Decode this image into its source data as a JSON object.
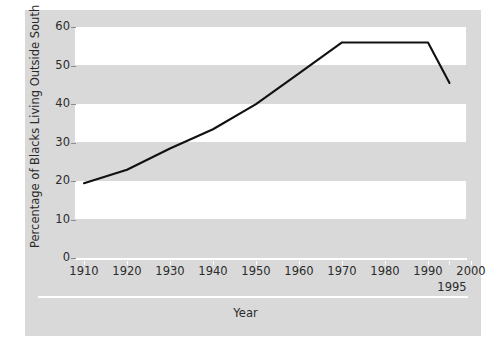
{
  "chart_data": {
    "type": "line",
    "title": "",
    "xlabel": "Year",
    "ylabel": "Percentage of Blacks Living Outside South",
    "x": [
      1910,
      1920,
      1930,
      1940,
      1950,
      1960,
      1970,
      1980,
      1990,
      1995
    ],
    "values": [
      19.5,
      23,
      28.5,
      33.5,
      40,
      48,
      56,
      56,
      56,
      45.5
    ],
    "series": [
      {
        "name": "Percentage of Blacks Living Outside South",
        "values": [
          19.5,
          23,
          28.5,
          33.5,
          40,
          48,
          56,
          56,
          56,
          45.5
        ]
      }
    ],
    "xlim": [
      1910,
      2000
    ],
    "ylim": [
      0,
      60
    ],
    "x_ticks": [
      1910,
      1920,
      1930,
      1940,
      1950,
      1960,
      1970,
      1980,
      1990,
      2000
    ],
    "x_tick_labels": [
      "1910",
      "1920",
      "1930",
      "1940",
      "1950",
      "1960",
      "1970",
      "1980",
      "1990",
      "2000"
    ],
    "x_extra_ticks": [
      1995
    ],
    "x_extra_tick_labels": [
      "1995"
    ],
    "y_ticks": [
      0,
      10,
      20,
      30,
      40,
      50,
      60
    ],
    "y_tick_labels": [
      "0",
      "10",
      "20",
      "30",
      "40",
      "50",
      "60"
    ],
    "grid": false,
    "banded_background": true,
    "legend": "none",
    "line_color": "#111111",
    "panel_color": "#d9d9d9",
    "band_color": "#ffffff"
  },
  "axes": {
    "y_label": "Percentage of Blacks Living Outside South",
    "x_label": "Year",
    "y_ticks": [
      "0",
      "10",
      "20",
      "30",
      "40",
      "50",
      "60"
    ],
    "x_ticks": [
      "1910",
      "1920",
      "1930",
      "1940",
      "1950",
      "1960",
      "1970",
      "1980",
      "1990",
      "2000"
    ],
    "x_tick_extra": "1995"
  }
}
